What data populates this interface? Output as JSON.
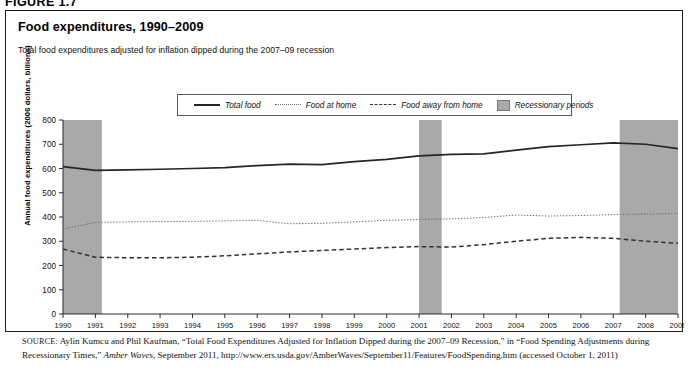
{
  "figure_label": "FIGURE 1.7",
  "title": "Food expenditures, 1990–2009",
  "subtitle": "Total food expenditures adjusted for inflation dipped during the 2007–09 recession",
  "legend": [
    {
      "label": "Total food",
      "style": "solid",
      "color": "#262626"
    },
    {
      "label": "Food at home",
      "style": "dotted",
      "color": "#6f6f6f"
    },
    {
      "label": "Food away from home",
      "style": "dashed",
      "color": "#333333"
    },
    {
      "label": "Recessionary periods",
      "style": "box",
      "color": "#a9a9a9"
    }
  ],
  "source": {
    "prefix": "SOURCE:",
    "line": " Aylin Kumcu and Phil Kaufman, “Total Food Expenditures Adjusted for Inflation Dipped during the 2007–09 Recession,” in “Food Spending Adjustments during Recessionary Times,” ",
    "italic": "Amber Waves",
    "line2": ", September 2011, http://www.ers.usda.gov/AmberWaves/September11/Features/FoodSpending.htm (accessed October 1, 2011)"
  },
  "chart_data": {
    "type": "line",
    "title": "Food expenditures, 1990–2009",
    "subtitle": "Total food expenditures adjusted for inflation dipped during the 2007–09 recession",
    "xlabel": "",
    "ylabel": "Annual food expenditures (2006 dollars, billions)",
    "x": [
      1990,
      1991,
      1992,
      1993,
      1994,
      1995,
      1996,
      1997,
      1998,
      1999,
      2000,
      2001,
      2002,
      2003,
      2004,
      2005,
      2006,
      2007,
      2008,
      2009
    ],
    "xtick_labels": [
      "1990",
      "1991",
      "1992",
      "1993",
      "1994",
      "1995",
      "1996",
      "1997",
      "1998",
      "1999",
      "2000",
      "2001",
      "2002",
      "2003",
      "2004",
      "2005",
      "2006",
      "2007",
      "2008",
      "2009"
    ],
    "ylim": [
      0,
      800
    ],
    "yticks": [
      0,
      100,
      200,
      300,
      400,
      500,
      600,
      700,
      800
    ],
    "ytick_labels": [
      "0",
      "100",
      "200",
      "300",
      "400",
      "500",
      "600",
      "700",
      "800"
    ],
    "grid": false,
    "legend_position": "top-center",
    "series": [
      {
        "name": "Total food",
        "style": "solid",
        "color": "#262626",
        "values": [
          608,
          592,
          594,
          597,
          600,
          604,
          612,
          618,
          616,
          628,
          638,
          652,
          658,
          660,
          676,
          690,
          698,
          706,
          700,
          682
        ]
      },
      {
        "name": "Food at home",
        "style": "dotted",
        "color": "#6f6f6f",
        "values": [
          350,
          378,
          380,
          381,
          382,
          384,
          386,
          372,
          374,
          380,
          386,
          390,
          392,
          398,
          408,
          404,
          406,
          410,
          412,
          414
        ]
      },
      {
        "name": "Food away from home",
        "style": "dashed",
        "color": "#333333",
        "values": [
          268,
          234,
          232,
          232,
          234,
          240,
          248,
          256,
          262,
          268,
          274,
          278,
          276,
          286,
          300,
          312,
          316,
          312,
          300,
          292
        ]
      }
    ],
    "shaded_regions": [
      {
        "name": "Recessionary periods",
        "start": 1990.0,
        "end": 1991.2,
        "color": "#a9a9a9"
      },
      {
        "name": "Recessionary periods",
        "start": 2001.0,
        "end": 2001.7,
        "color": "#a9a9a9"
      },
      {
        "name": "Recessionary periods",
        "start": 2007.2,
        "end": 2009.0,
        "color": "#a9a9a9"
      }
    ]
  }
}
